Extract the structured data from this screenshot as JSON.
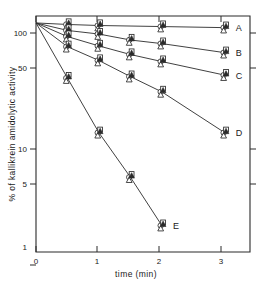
{
  "chart_data": {
    "type": "line",
    "title": "",
    "subtitle": "",
    "xlabel": "time (min)",
    "ylabel": "% of kallikrein amidolytic activity",
    "xlim": [
      0,
      3.4
    ],
    "ylim": [
      1,
      115
    ],
    "yscale": "log",
    "xscale": "linear",
    "grid": false,
    "legend_position": "right-inline-labels",
    "xticks": [
      0,
      1,
      2,
      3
    ],
    "xtick_labels": [
      "0",
      "1",
      "2",
      "3"
    ],
    "yticks": [
      1,
      5,
      10,
      50,
      100
    ],
    "ytick_labels": [
      "1",
      "5",
      "10",
      "50",
      "100"
    ],
    "marker_kinds": [
      "open-circle",
      "open-square",
      "open-triangle",
      "filled-triangle"
    ],
    "series": [
      {
        "name": "A",
        "label": "A",
        "x": [
          0,
          0.5,
          1,
          2,
          3
        ],
        "values": [
          100,
          97,
          95,
          93,
          91
        ],
        "markers": [
          "none",
          "open-circle",
          "open-circle",
          "open-circle",
          "open-circle"
        ]
      },
      {
        "name": "B",
        "label": "B",
        "x": [
          0,
          0.5,
          1,
          1.5,
          2,
          3
        ],
        "values": [
          100,
          86,
          80,
          71,
          66,
          55
        ],
        "markers": [
          "none",
          "open-square",
          "open-circle",
          "open-square",
          "open-circle",
          "open-square"
        ]
      },
      {
        "name": "C",
        "label": "C",
        "x": [
          0,
          0.5,
          1,
          1.5,
          2,
          3
        ],
        "values": [
          100,
          76,
          63,
          53,
          46,
          35
        ],
        "markers": [
          "none",
          "open-triangle",
          "open-square",
          "open-circle",
          "open-triangle",
          "open-square"
        ]
      },
      {
        "name": "D",
        "label": "D",
        "x": [
          0,
          0.5,
          1,
          1.5,
          2,
          3
        ],
        "values": [
          100,
          62,
          47,
          34,
          25,
          11
        ],
        "markers": [
          "none",
          "open-circle",
          "open-triangle",
          "open-circle",
          "open-square",
          "open-circle"
        ]
      },
      {
        "name": "E",
        "label": "E",
        "x": [
          0,
          0.5,
          1,
          1.5,
          2
        ],
        "values": [
          100,
          33,
          11,
          4.5,
          1.7
        ],
        "markers": [
          "none",
          "open-square",
          "open-square",
          "open-triangle",
          "filled-triangle"
        ]
      }
    ]
  },
  "axes": {
    "y_title": "% of kallikrein amidolytic activity",
    "x_title": "time (min)"
  }
}
